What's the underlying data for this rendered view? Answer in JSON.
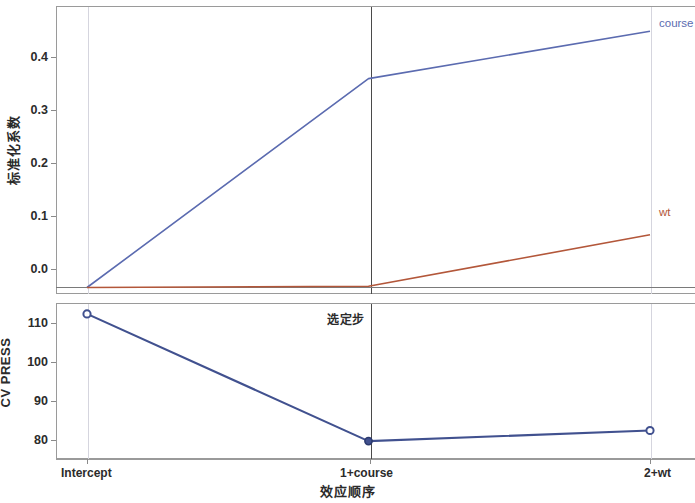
{
  "chart_data": [
    {
      "type": "line",
      "panel": "top",
      "title": "",
      "xlabel": "效应顺序",
      "ylabel": "标准化系数",
      "categories": [
        "Intercept",
        "1+course",
        "2+wt"
      ],
      "yticks": [
        "0.0",
        "0.1",
        "0.2",
        "0.3",
        "0.4"
      ],
      "ylim": [
        -0.01,
        0.48
      ],
      "grid": false,
      "legend_position": "right-inline",
      "series": [
        {
          "name": "course",
          "color": "#5b6bb0",
          "values": [
            0.0,
            0.357,
            0.438
          ]
        },
        {
          "name": "wt",
          "color": "#b3573a",
          "values": [
            0.0,
            0.002,
            0.09
          ]
        }
      ],
      "annotations": [
        "course",
        "wt"
      ],
      "reference_lines": [
        {
          "at": "1+course",
          "style": "solid-dark",
          "label": "选定步"
        },
        {
          "at": "Intercept",
          "style": "faint"
        },
        {
          "at": "2+wt",
          "style": "faint"
        }
      ],
      "zero_line": 0.0
    },
    {
      "type": "line",
      "panel": "bottom",
      "title": "",
      "xlabel": "效应顺序",
      "ylabel": "CV PRESS",
      "categories": [
        "Intercept",
        "1+course",
        "2+wt"
      ],
      "yticks": [
        "80",
        "90",
        "100",
        "110"
      ],
      "ylim": [
        76,
        116
      ],
      "grid": false,
      "markers": true,
      "series": [
        {
          "name": "CV PRESS",
          "color": "#41518f",
          "values": [
            113.2,
            80.6,
            83.3
          ]
        }
      ],
      "reference_lines": [
        {
          "at": "1+course",
          "style": "solid-dark",
          "label": "选定步"
        },
        {
          "at": "Intercept",
          "style": "faint"
        },
        {
          "at": "2+wt",
          "style": "faint"
        }
      ]
    }
  ],
  "labels": {
    "ylabel_top": "标准化系数",
    "ylabel_bottom": "CV PRESS",
    "xlabel": "效应顺序",
    "selected_step": "选定步",
    "series_course": "course",
    "series_wt": "wt",
    "xticks": [
      "Intercept",
      "1+course",
      "2+wt"
    ],
    "yticks_top": [
      "0.4",
      "0.3",
      "0.2",
      "0.1",
      "0.0"
    ],
    "yticks_bottom": [
      "110",
      "100",
      "90",
      "80"
    ]
  },
  "colors": {
    "course": "#5b6bb0",
    "wt": "#b3573a",
    "cvpress": "#41518f",
    "frame": "#9a9a9a",
    "reference_strong": "#4a4a4a",
    "reference_faint": "#d5d5de",
    "text": "#2b2b2b",
    "background": "#ffffff"
  }
}
